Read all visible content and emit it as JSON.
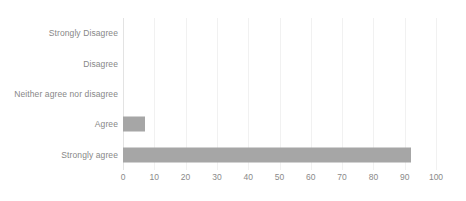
{
  "chart_data": {
    "type": "bar",
    "orientation": "horizontal",
    "title": "",
    "subtitle": "",
    "xlabel": "",
    "ylabel": "",
    "categories": [
      "Strongly Disagree",
      "Disagree",
      "Neither agree nor disagree",
      "Agree",
      "Strongly agree"
    ],
    "values": [
      0,
      0,
      0,
      7,
      92
    ],
    "series": [
      {
        "name": "Responses",
        "values": [
          0,
          0,
          0,
          7,
          92
        ]
      }
    ],
    "xlim": [
      0,
      100
    ],
    "xticks": [
      0,
      10,
      20,
      30,
      40,
      50,
      60,
      70,
      80,
      90,
      100
    ],
    "xtick_labels": [
      "0",
      "10",
      "20",
      "30",
      "40",
      "50",
      "60",
      "70",
      "80",
      "90",
      "100"
    ],
    "grid": "vertical",
    "legend": "none",
    "bar_color": "#a6a6a6",
    "gridline_color": "#f1f1f1",
    "axis_line_color": "#e3e3e3",
    "label_color": "#878787",
    "background_color": "#ffffff"
  }
}
